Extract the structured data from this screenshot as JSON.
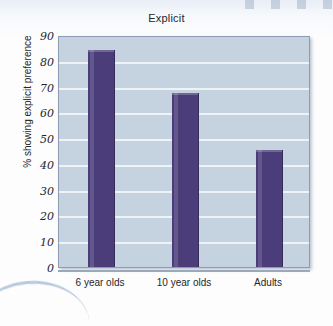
{
  "chart_data": {
    "type": "bar",
    "title": "Explicit",
    "xlabel": "",
    "ylabel": "% showing explicit preference",
    "categories": [
      "6 year olds",
      "10 year olds",
      "Adults"
    ],
    "values": [
      84,
      67.5,
      45.5
    ],
    "ylim": [
      0,
      90
    ],
    "yticks": [
      0,
      10,
      20,
      30,
      40,
      50,
      60,
      70,
      80,
      90
    ],
    "ytick_labels": [
      "0",
      "10",
      "20",
      "30",
      "40",
      "50",
      "60",
      "70",
      "80",
      "90"
    ],
    "grid": true,
    "legend": false,
    "colors": {
      "bar": "#4a3d7a",
      "plot_background": "#c5d2e0",
      "gridline": "#eef3f8",
      "axis": "#8d9cb0",
      "text": "#24262b",
      "page_background": "#fdfdfe"
    }
  }
}
